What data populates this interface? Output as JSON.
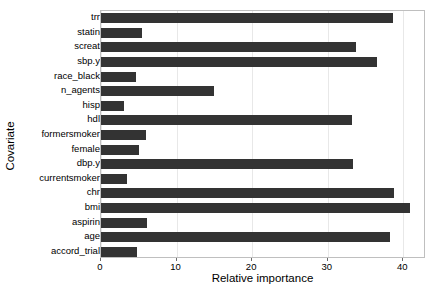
{
  "chart_data": {
    "type": "bar",
    "orientation": "horizontal",
    "title": "",
    "xlabel": "Relative importance",
    "ylabel": "Covariate",
    "xlim": [
      0,
      43
    ],
    "xticks": [
      0,
      10,
      20,
      30,
      40
    ],
    "xtick_labels": [
      "0",
      "10",
      "20",
      "30",
      "40"
    ],
    "grid": true,
    "grid_axis": "x",
    "legend": false,
    "bar_color": "#333333",
    "panel_border_color": "#bfbfbf",
    "categories": [
      "trr",
      "statin",
      "screat",
      "sbp.y",
      "race_black",
      "n_agents",
      "hisp",
      "hdl",
      "formersmoker",
      "female",
      "dbp.y",
      "currentsmoker",
      "chr",
      "bmi",
      "aspirin",
      "age",
      "accord_trial"
    ],
    "values": [
      38.6,
      5.4,
      33.8,
      36.5,
      4.6,
      15.0,
      3.0,
      33.2,
      5.9,
      5.0,
      33.4,
      3.4,
      38.8,
      40.9,
      6.1,
      38.3,
      4.7
    ]
  }
}
